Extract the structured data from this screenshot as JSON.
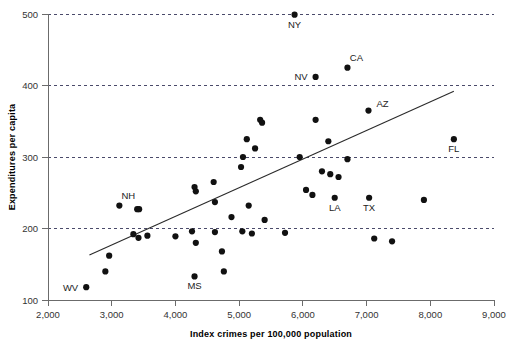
{
  "chart_data": {
    "type": "scatter",
    "title": "",
    "xlabel": "Index crimes per 100,000 population",
    "ylabel": "Expenditures per capita",
    "xlim": [
      2000,
      9000
    ],
    "ylim": [
      100,
      500
    ],
    "xticks": [
      2000,
      3000,
      4000,
      5000,
      6000,
      7000,
      8000,
      9000
    ],
    "xticklabels": [
      "2,000",
      "3,000",
      "4,000",
      "5,000",
      "6,000",
      "7,000",
      "8,000",
      "9,000"
    ],
    "yticks": [
      100,
      200,
      300,
      400,
      500
    ],
    "yticklabels": [
      "100",
      "200",
      "300",
      "400",
      "500"
    ],
    "grid": "horizontal-dashed",
    "legend": "none",
    "points": [
      {
        "x": 5870,
        "y": 499,
        "label": "NY",
        "label_pos": "below"
      },
      {
        "x": 6700,
        "y": 425,
        "label": "CA",
        "label_pos": "above"
      },
      {
        "x": 6200,
        "y": 412,
        "label": "NV",
        "label_pos": "left"
      },
      {
        "x": 7030,
        "y": 365,
        "label": "AZ",
        "label_pos": "right"
      },
      {
        "x": 8370,
        "y": 325,
        "label": "FL",
        "label_pos": "below"
      },
      {
        "x": 3120,
        "y": 232,
        "label": "NH",
        "label_pos": "above"
      },
      {
        "x": 6500,
        "y": 243,
        "label": "LA",
        "label_pos": "below"
      },
      {
        "x": 7040,
        "y": 243,
        "label": "TX",
        "label_pos": "below"
      },
      {
        "x": 4300,
        "y": 133,
        "label": "MS",
        "label_pos": "below"
      },
      {
        "x": 2600,
        "y": 118,
        "label": "WV",
        "label_pos": "left"
      },
      {
        "x": 5330,
        "y": 352,
        "label": "",
        "label_pos": ""
      },
      {
        "x": 5360,
        "y": 348,
        "label": "",
        "label_pos": ""
      },
      {
        "x": 6200,
        "y": 352,
        "label": "",
        "label_pos": ""
      },
      {
        "x": 5120,
        "y": 325,
        "label": "",
        "label_pos": ""
      },
      {
        "x": 5250,
        "y": 312,
        "label": "",
        "label_pos": ""
      },
      {
        "x": 6400,
        "y": 322,
        "label": "",
        "label_pos": ""
      },
      {
        "x": 5060,
        "y": 300,
        "label": "",
        "label_pos": ""
      },
      {
        "x": 5950,
        "y": 300,
        "label": "",
        "label_pos": ""
      },
      {
        "x": 5030,
        "y": 286,
        "label": "",
        "label_pos": ""
      },
      {
        "x": 6700,
        "y": 297,
        "label": "",
        "label_pos": ""
      },
      {
        "x": 4600,
        "y": 265,
        "label": "",
        "label_pos": ""
      },
      {
        "x": 4300,
        "y": 258,
        "label": "",
        "label_pos": ""
      },
      {
        "x": 4320,
        "y": 252,
        "label": "",
        "label_pos": ""
      },
      {
        "x": 6300,
        "y": 280,
        "label": "",
        "label_pos": ""
      },
      {
        "x": 6430,
        "y": 276,
        "label": "",
        "label_pos": ""
      },
      {
        "x": 6560,
        "y": 272,
        "label": "",
        "label_pos": ""
      },
      {
        "x": 4620,
        "y": 237,
        "label": "",
        "label_pos": ""
      },
      {
        "x": 5150,
        "y": 232,
        "label": "",
        "label_pos": ""
      },
      {
        "x": 7900,
        "y": 240,
        "label": "",
        "label_pos": ""
      },
      {
        "x": 3400,
        "y": 227,
        "label": "",
        "label_pos": ""
      },
      {
        "x": 6050,
        "y": 254,
        "label": "",
        "label_pos": ""
      },
      {
        "x": 6150,
        "y": 247,
        "label": "",
        "label_pos": ""
      },
      {
        "x": 4880,
        "y": 216,
        "label": "",
        "label_pos": ""
      },
      {
        "x": 5400,
        "y": 212,
        "label": "",
        "label_pos": ""
      },
      {
        "x": 3340,
        "y": 192,
        "label": "",
        "label_pos": ""
      },
      {
        "x": 3420,
        "y": 187,
        "label": "",
        "label_pos": ""
      },
      {
        "x": 3560,
        "y": 190,
        "label": "",
        "label_pos": ""
      },
      {
        "x": 4000,
        "y": 189,
        "label": "",
        "label_pos": ""
      },
      {
        "x": 4260,
        "y": 196,
        "label": "",
        "label_pos": ""
      },
      {
        "x": 4620,
        "y": 195,
        "label": "",
        "label_pos": ""
      },
      {
        "x": 5050,
        "y": 196,
        "label": "",
        "label_pos": ""
      },
      {
        "x": 5200,
        "y": 193,
        "label": "",
        "label_pos": ""
      },
      {
        "x": 4320,
        "y": 180,
        "label": "",
        "label_pos": ""
      },
      {
        "x": 5720,
        "y": 194,
        "label": "",
        "label_pos": ""
      },
      {
        "x": 7120,
        "y": 186,
        "label": "",
        "label_pos": ""
      },
      {
        "x": 7400,
        "y": 182,
        "label": "",
        "label_pos": ""
      },
      {
        "x": 4730,
        "y": 168,
        "label": "",
        "label_pos": ""
      },
      {
        "x": 2960,
        "y": 162,
        "label": "",
        "label_pos": ""
      },
      {
        "x": 2900,
        "y": 140,
        "label": "",
        "label_pos": ""
      },
      {
        "x": 4760,
        "y": 140,
        "label": "",
        "label_pos": ""
      },
      {
        "x": 3430,
        "y": 227,
        "label": "",
        "label_pos": ""
      }
    ],
    "fit_line": {
      "x1": 2650,
      "y1": 163,
      "x2": 8370,
      "y2": 392
    }
  }
}
